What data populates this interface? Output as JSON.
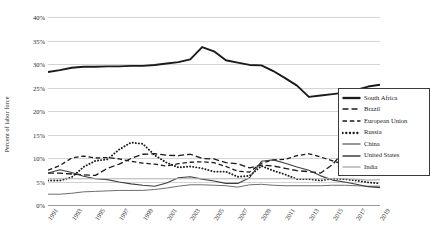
{
  "chart_data": {
    "type": "line",
    "title": "",
    "xlabel": "",
    "ylabel": "Percent of labor force",
    "ylim": [
      0,
      40
    ],
    "ytick_labels": [
      "40%",
      "35%",
      "30%",
      "25%",
      "20%",
      "15%",
      "10%",
      "5%",
      "0%"
    ],
    "ytick_values": [
      40,
      35,
      30,
      25,
      20,
      15,
      10,
      5,
      0
    ],
    "grid": true,
    "legend_position": "right",
    "x": [
      1991,
      1992,
      1993,
      1994,
      1995,
      1996,
      1997,
      1998,
      1999,
      2000,
      2001,
      2002,
      2003,
      2004,
      2005,
      2006,
      2007,
      2008,
      2009,
      2010,
      2011,
      2012,
      2013,
      2014,
      2015,
      2016,
      2017,
      2018,
      2019
    ],
    "xtick_labels": [
      "1991",
      "1993",
      "1995",
      "1997",
      "1999",
      "2001",
      "2003",
      "2005",
      "2007",
      "2009",
      "2011",
      "2013",
      "2015",
      "2017",
      "2019"
    ],
    "xtick_values": [
      1991,
      1993,
      1995,
      1997,
      1999,
      2001,
      2003,
      2005,
      2007,
      2009,
      2011,
      2013,
      2015,
      2017,
      2019
    ],
    "series": [
      {
        "name": "South Africa",
        "style": "solid",
        "color": "#1a1a1a",
        "width": 1.9,
        "values": [
          28.3,
          28.7,
          29.2,
          29.4,
          29.4,
          29.5,
          29.5,
          29.6,
          29.6,
          29.8,
          30.1,
          30.4,
          31.0,
          33.6,
          32.7,
          30.8,
          30.3,
          29.8,
          29.7,
          28.5,
          27.0,
          25.4,
          23.0,
          23.3,
          23.6,
          23.9,
          24.5,
          25.2,
          25.6
        ]
      },
      {
        "name": "Brazil",
        "style": "dash-long",
        "color": "#1a1a1a",
        "width": 1.3,
        "values": [
          6.8,
          6.8,
          6.6,
          6.4,
          6.3,
          7.8,
          8.7,
          9.9,
          10.8,
          10.9,
          10.6,
          10.5,
          10.8,
          9.9,
          9.8,
          9.0,
          8.8,
          7.9,
          8.5,
          8.3,
          7.8,
          7.3,
          7.1,
          6.8,
          8.6,
          11.6,
          12.8,
          12.3,
          11.9
        ]
      },
      {
        "name": "European Union",
        "style": "dash-med",
        "color": "#1a1a1a",
        "width": 1.3,
        "values": [
          7.4,
          8.4,
          10.0,
          10.4,
          10.0,
          10.1,
          9.8,
          9.3,
          8.9,
          8.7,
          8.3,
          8.8,
          9.1,
          9.2,
          9.0,
          8.2,
          7.2,
          7.0,
          8.9,
          9.6,
          9.7,
          10.5,
          10.9,
          10.2,
          9.4,
          8.6,
          7.6,
          6.8,
          6.3
        ]
      },
      {
        "name": "Russia",
        "style": "dotted",
        "color": "#1a1a1a",
        "width": 1.9,
        "values": [
          5.2,
          5.2,
          5.9,
          8.1,
          9.4,
          9.7,
          11.8,
          13.3,
          13.0,
          10.6,
          9.0,
          8.0,
          8.2,
          7.8,
          7.1,
          7.1,
          6.0,
          6.2,
          8.3,
          7.3,
          6.5,
          5.5,
          5.5,
          5.2,
          5.6,
          5.5,
          5.2,
          4.8,
          4.6
        ]
      },
      {
        "name": "China",
        "style": "solid",
        "color": "#6e6e6e",
        "width": 1.0,
        "values": [
          2.3,
          2.3,
          2.5,
          2.8,
          2.9,
          3.0,
          3.1,
          3.1,
          3.1,
          3.3,
          3.6,
          4.0,
          4.3,
          4.3,
          4.2,
          4.1,
          3.8,
          4.3,
          4.4,
          4.2,
          4.1,
          4.1,
          4.1,
          4.1,
          4.2,
          4.2,
          4.1,
          4.0,
          4.0
        ]
      },
      {
        "name": "United States",
        "style": "solid",
        "color": "#3d3d3d",
        "width": 1.1,
        "values": [
          6.8,
          7.5,
          6.9,
          6.1,
          5.6,
          5.4,
          4.9,
          4.5,
          4.2,
          4.0,
          4.7,
          5.8,
          6.0,
          5.5,
          5.1,
          4.6,
          4.6,
          5.8,
          9.3,
          9.6,
          8.9,
          8.1,
          7.4,
          6.2,
          5.3,
          4.9,
          4.4,
          3.9,
          3.7
        ]
      },
      {
        "name": "India",
        "style": "solid",
        "color": "#b2b2b2",
        "width": 1.1,
        "values": [
          5.6,
          5.6,
          5.6,
          5.6,
          5.6,
          5.6,
          5.6,
          5.6,
          5.6,
          5.6,
          5.6,
          5.6,
          5.6,
          5.6,
          5.6,
          5.6,
          5.6,
          5.6,
          5.6,
          5.6,
          5.6,
          5.6,
          5.6,
          5.6,
          5.6,
          5.6,
          5.5,
          5.3,
          5.4
        ]
      }
    ]
  },
  "legend": {
    "items": [
      {
        "label": "South Africa"
      },
      {
        "label": "Brazil"
      },
      {
        "label": "European Union"
      },
      {
        "label": "Russia"
      },
      {
        "label": "China"
      },
      {
        "label": "United States"
      },
      {
        "label": "India"
      }
    ]
  }
}
